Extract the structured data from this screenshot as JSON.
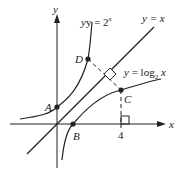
{
  "diagram": {
    "axes": {
      "x_label": "x",
      "y_label": "y"
    },
    "curves": {
      "exp_label_prefix": "y = 2",
      "exp_label_sup": "x",
      "identity_label": "y = x",
      "log_label_prefix": "y = log",
      "log_label_sub": "2",
      "log_label_suffix": " x"
    },
    "points": {
      "A": "A",
      "B": "B",
      "C": "C",
      "D": "D"
    },
    "tick_label": "4",
    "colors": {
      "stroke": "#222222"
    }
  }
}
